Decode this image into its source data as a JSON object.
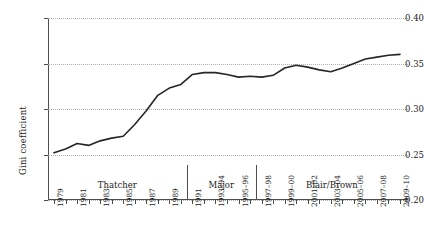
{
  "chart_data": {
    "type": "line",
    "title": "",
    "xlabel": "",
    "ylabel": "Gini coefficient",
    "ylim": [
      0.2,
      0.4
    ],
    "ytick_values": [
      0.2,
      0.25,
      0.3,
      0.35,
      0.4
    ],
    "ytick_labels": [
      "0.20",
      "0.25",
      "0.30",
      "0.35",
      "0.40"
    ],
    "grid": "horizontal-dotted",
    "legend": "none",
    "line_color": "#262626",
    "categories": [
      "1979",
      "1980",
      "1981",
      "1982",
      "1983",
      "1984",
      "1985",
      "1986",
      "1987",
      "1988",
      "1989",
      "1990",
      "1991",
      "1992",
      "1993-94",
      "1994-95",
      "1995-96",
      "1996-97",
      "1997-98",
      "1998-99",
      "1999-00",
      "2000-01",
      "2001-02",
      "2002-03",
      "2003-04",
      "2004-05",
      "2005-06",
      "2006-07",
      "2007-08",
      "2008-09",
      "2009-10"
    ],
    "xtick_labels_shown": [
      "1979",
      "1981",
      "1983",
      "1985",
      "1987",
      "1989",
      "1991",
      "1993-94",
      "1995-96",
      "1997-98",
      "1999-00",
      "2001-02",
      "2003-04",
      "2005-06",
      "2007-08",
      "2009-10"
    ],
    "values": [
      0.252,
      0.256,
      0.262,
      0.26,
      0.265,
      0.268,
      0.27,
      0.283,
      0.298,
      0.315,
      0.323,
      0.327,
      0.338,
      0.34,
      0.34,
      0.338,
      0.335,
      0.336,
      0.335,
      0.337,
      0.345,
      0.348,
      0.346,
      0.343,
      0.341,
      0.345,
      0.35,
      0.355,
      0.357,
      0.359,
      0.36
    ],
    "annotations": [
      {
        "label": "Thatcher",
        "start": "1979",
        "end": "1990"
      },
      {
        "label": "Major",
        "start": "1991",
        "end": "1996-97"
      },
      {
        "label": "Blair/Brown",
        "start": "1997-98",
        "end": "2009-10"
      }
    ],
    "dividers": [
      {
        "after": "1990"
      },
      {
        "after": "1996-97"
      }
    ]
  }
}
